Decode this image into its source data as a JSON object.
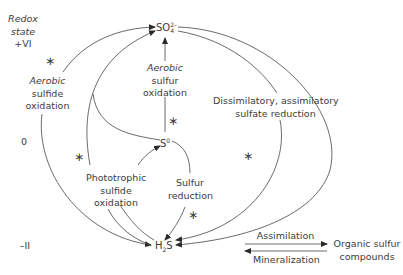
{
  "axis": {
    "title_line1": "Redox",
    "title_line2": "state",
    "levels": [
      "+VI",
      "0",
      "–II"
    ]
  },
  "compounds": {
    "sulfate": {
      "base": "SO",
      "sub": "4",
      "sup": "2–"
    },
    "sulfur": {
      "base": "S",
      "sup": "0"
    },
    "sulfide": {
      "base": "H",
      "sub": "2",
      "tail": "S"
    },
    "organic": {
      "line1": "Organic sulfur",
      "line2": "compounds"
    }
  },
  "processes": {
    "aerobic_sulfide_oxidation": [
      "Aerobic",
      "sulfide",
      "oxidation"
    ],
    "aerobic_sulfur_oxidation": [
      "Aerobic",
      "sulfur",
      "oxidation"
    ],
    "phototrophic_sulfide_oxidation": [
      "Phototrophic",
      "sulfide",
      "oxidation"
    ],
    "sulfur_reduction": [
      "Sulfur",
      "reduction"
    ],
    "sulfate_reduction": [
      "Dissimilatory, assimilatory",
      "sulfate reduction"
    ],
    "assimilation": "Assimilation",
    "mineralization": "Mineralization"
  },
  "markers": {
    "star_symbol": "∗"
  },
  "colors": {
    "line": "#3a3a3a",
    "text": "#3c3c3c",
    "background": "#ffffff"
  }
}
